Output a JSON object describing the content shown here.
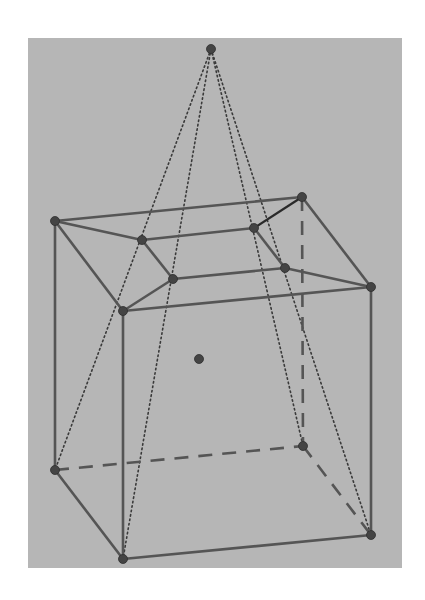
{
  "diagram": {
    "type": "3d-geometry",
    "colors": {
      "page_background": "#ffffff",
      "panel_background": "#b6b6b6",
      "edge": "#555555",
      "dark_edge": "#2a2a2a",
      "vertex": "#444444"
    },
    "panel": {
      "x": 28,
      "y": 38,
      "width": 374,
      "height": 530
    },
    "vertices": {
      "apex": [
        211,
        49
      ],
      "top_back_left": [
        55,
        221
      ],
      "top_back_right": [
        302,
        197
      ],
      "top_front_left": [
        123,
        311
      ],
      "top_front_right": [
        371,
        287
      ],
      "inner_back_left": [
        142,
        240
      ],
      "inner_back_right": [
        254,
        228
      ],
      "inner_front_left": [
        173,
        279
      ],
      "inner_front_right": [
        285,
        268
      ],
      "bottom_back_left": [
        55,
        470
      ],
      "bottom_back_right": [
        303,
        446
      ],
      "bottom_front_left": [
        123,
        559
      ],
      "bottom_front_right": [
        371,
        535
      ],
      "center": [
        199,
        359
      ]
    },
    "solid_edges": [
      [
        "top_back_left",
        "top_back_right"
      ],
      [
        "top_back_left",
        "top_front_left"
      ],
      [
        "top_front_left",
        "top_front_right"
      ],
      [
        "top_back_right",
        "top_front_right"
      ],
      [
        "top_back_left",
        "inner_back_left"
      ],
      [
        "top_front_left",
        "inner_front_left"
      ],
      [
        "top_front_right",
        "inner_front_right"
      ],
      [
        "inner_back_left",
        "inner_back_right"
      ],
      [
        "inner_back_left",
        "inner_front_left"
      ],
      [
        "inner_front_left",
        "inner_front_right"
      ],
      [
        "top_back_left",
        "bottom_back_left"
      ],
      [
        "top_front_left",
        "bottom_front_left"
      ],
      [
        "top_front_right",
        "bottom_front_right"
      ],
      [
        "bottom_back_left",
        "bottom_front_left"
      ],
      [
        "bottom_front_left",
        "bottom_front_right"
      ]
    ],
    "dark_edges": [
      [
        "inner_back_right",
        "top_back_right"
      ]
    ],
    "inner_partial_edges": [
      [
        "inner_back_right",
        "inner_front_right"
      ]
    ],
    "dashed_edges": [
      [
        "top_back_right",
        "bottom_back_right"
      ],
      [
        "bottom_back_left",
        "bottom_back_right"
      ],
      [
        "bottom_back_right",
        "bottom_front_right"
      ]
    ],
    "dotted_edges": [
      [
        "apex",
        "bottom_back_left"
      ],
      [
        "apex",
        "bottom_front_left"
      ],
      [
        "apex",
        "bottom_back_right"
      ],
      [
        "apex",
        "bottom_front_right"
      ]
    ],
    "labels": []
  }
}
